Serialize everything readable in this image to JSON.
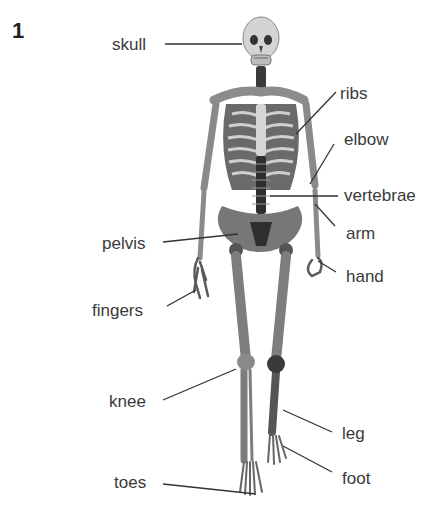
{
  "figure_number": "1",
  "labels": {
    "skull": "skull",
    "ribs": "ribs",
    "elbow": "elbow",
    "vertebrae": "vertebrae",
    "arm": "arm",
    "pelvis": "pelvis",
    "hand": "hand",
    "fingers": "fingers",
    "knee": "knee",
    "leg": "leg",
    "foot": "foot",
    "toes": "toes"
  },
  "colors": {
    "bone": "#9a9a9a",
    "bone_dark": "#555555",
    "leader_line": "#333333",
    "text": "#3a3a3a"
  }
}
